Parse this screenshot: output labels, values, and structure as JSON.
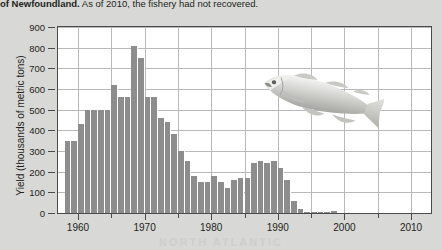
{
  "caption": {
    "bold_text": "of Newfoundland.",
    "rest_text": " As of 2010, the fishery had not recovered."
  },
  "watermark": "NORTH ATLANTIC",
  "figure": {
    "fish_illustration_name": "atlantic-cod-illustration"
  },
  "colors": {
    "page_background": "#d8d8d6",
    "plot_background": "#ffffff",
    "bar_fill": "#8d8d8d",
    "grid_line": "#b9b9b9",
    "axis_line": "#4a4a4a",
    "text": "#231f20"
  },
  "chart_data": {
    "type": "bar",
    "title": "",
    "xlabel": "",
    "ylabel": "Yield (thousands of metric tons)",
    "xlim": [
      1957,
      2013
    ],
    "ylim": [
      0,
      900
    ],
    "grid": true,
    "legend": "none",
    "y_ticks": [
      900,
      800,
      700,
      600,
      500,
      400,
      300,
      200,
      100,
      0
    ],
    "x_ticks_major": [
      1960,
      1970,
      1980,
      1990,
      2000,
      2010
    ],
    "x_ticks_minor": [
      1965,
      1975,
      1985,
      1995,
      2005
    ],
    "x": [
      1958,
      1959,
      1960,
      1961,
      1962,
      1963,
      1964,
      1965,
      1966,
      1967,
      1968,
      1969,
      1970,
      1971,
      1972,
      1973,
      1974,
      1975,
      1976,
      1977,
      1978,
      1979,
      1980,
      1981,
      1982,
      1983,
      1984,
      1985,
      1986,
      1987,
      1988,
      1989,
      1990,
      1991,
      1992,
      1993,
      1994,
      1995,
      1996,
      1997,
      1998,
      1999,
      2000,
      2001,
      2002,
      2003,
      2004,
      2005,
      2006,
      2007,
      2008,
      2009,
      2010
    ],
    "values": [
      350,
      350,
      430,
      500,
      500,
      500,
      500,
      620,
      560,
      560,
      810,
      750,
      560,
      560,
      460,
      440,
      380,
      300,
      250,
      180,
      150,
      150,
      180,
      150,
      120,
      160,
      170,
      170,
      240,
      250,
      240,
      250,
      220,
      160,
      60,
      20,
      5,
      3,
      2,
      2,
      10,
      0,
      0,
      0,
      0,
      0,
      0,
      0,
      0,
      0,
      0,
      0,
      0
    ],
    "categories": null,
    "annotations": [
      {
        "name": "atlantic-cod-illustration",
        "x_range": [
          1978,
          1998
        ],
        "y_range": [
          480,
          800
        ]
      }
    ]
  }
}
